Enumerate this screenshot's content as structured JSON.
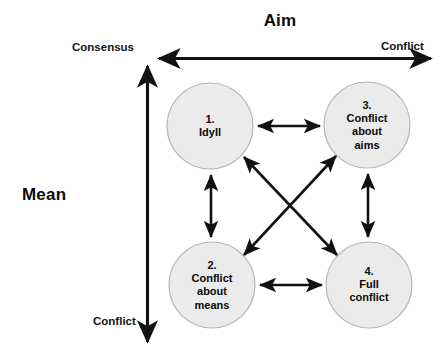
{
  "diagram": {
    "title": "Aim",
    "vertical_axis_title": "Mean",
    "axes": {
      "horizontal": {
        "name": "Aim",
        "left_label": "Consensus",
        "right_label": "Conflict"
      },
      "vertical": {
        "name": "Mean",
        "top_label": "Consensus",
        "bottom_label": "Conflict"
      }
    },
    "nodes": [
      {
        "id": "node-1",
        "number": "1.",
        "label": "1.\nIdyll",
        "name": "Idyll",
        "cx": 210,
        "cy": 126,
        "r": 43
      },
      {
        "id": "node-3",
        "number": "3.",
        "label": "3.\nConflict\nabout\naims",
        "name": "Conflict about aims",
        "cx": 367,
        "cy": 125,
        "r": 43
      },
      {
        "id": "node-2",
        "number": "2.",
        "label": "2.\nConflict\nabout\nmeans",
        "name": "Conflict about means",
        "cx": 212,
        "cy": 285,
        "r": 43
      },
      {
        "id": "node-4",
        "number": "4.",
        "label": "4.\nFull\nconflict",
        "name": "Full conflict",
        "cx": 369,
        "cy": 285,
        "r": 43
      }
    ],
    "connectors": [
      {
        "id": "conn-1-3",
        "from": "node-1",
        "to": "node-3",
        "style": "double-arrow"
      },
      {
        "id": "conn-2-4",
        "from": "node-2",
        "to": "node-4",
        "style": "double-arrow"
      },
      {
        "id": "conn-1-2",
        "from": "node-1",
        "to": "node-2",
        "style": "double-arrow"
      },
      {
        "id": "conn-3-4",
        "from": "node-3",
        "to": "node-4",
        "style": "double-arrow"
      },
      {
        "id": "conn-1-4",
        "from": "node-1",
        "to": "node-4",
        "style": "double-arrow"
      },
      {
        "id": "conn-3-2",
        "from": "node-3",
        "to": "node-2",
        "style": "double-arrow"
      }
    ],
    "colors": {
      "background": "#ffffff",
      "node_fill": "#ebebeb",
      "node_stroke": "#b3b3b3",
      "line": "#111111",
      "text": "#0a0a0a"
    }
  }
}
